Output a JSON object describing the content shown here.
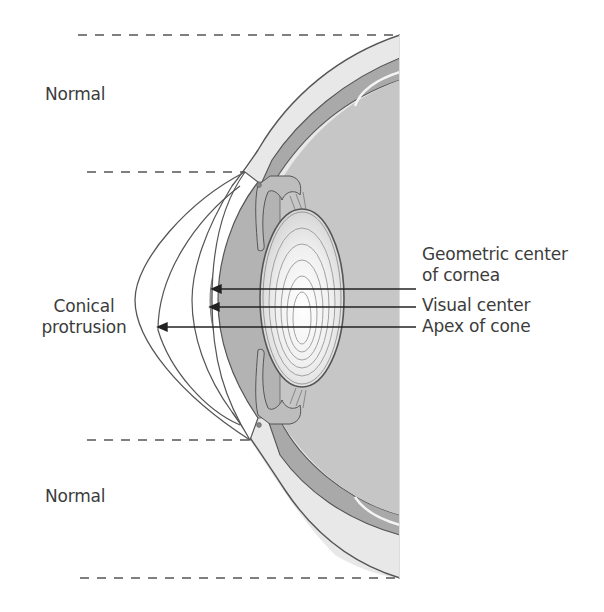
{
  "figure": {
    "colors": {
      "background": "#ffffff",
      "line": "#555555",
      "text": "#3c3c3c",
      "sclera": "#e6e6e6",
      "choroid": "#a9a9a9",
      "vitreous": "#c8c8c8",
      "anterior_chamber": "#b5b5b5",
      "iris": "#bdbdbd",
      "lens_center": "#ffffff",
      "lens_edge": "#cfcfcf"
    }
  },
  "labels": {
    "normal_top": "Normal",
    "conical_line1": "Conical",
    "conical_line2": "protrusion",
    "normal_bottom": "Normal",
    "geometric_line1": "Geometric center",
    "geometric_line2": "of cornea",
    "visual_center": "Visual center",
    "apex_of_cone": "Apex of cone"
  },
  "guides": [
    {
      "name": "top-boundary",
      "y": 35,
      "x1": 78,
      "x2": 400
    },
    {
      "name": "upper-cone-boundary",
      "y": 172,
      "x1": 87,
      "x2": 245
    },
    {
      "name": "lower-cone-boundary",
      "y": 440,
      "x1": 87,
      "x2": 250
    },
    {
      "name": "bottom-boundary",
      "y": 578,
      "x1": 80,
      "x2": 400
    }
  ],
  "pointers": [
    {
      "name": "geometric-center-arrow",
      "y": 289,
      "from_x": 400,
      "to_x": 213
    },
    {
      "name": "visual-center-arrow",
      "y": 307,
      "from_x": 400,
      "to_x": 211
    },
    {
      "name": "apex-of-cone-arrow",
      "y": 327,
      "from_x": 400,
      "to_x": 158
    }
  ]
}
